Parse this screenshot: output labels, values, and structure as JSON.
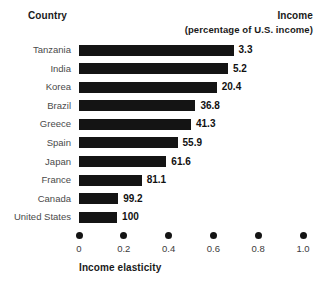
{
  "header": {
    "country_label": "Country",
    "income_label": "Income",
    "income_sublabel": "(percentage of U.S. income)"
  },
  "chart_data": {
    "type": "bar",
    "orientation": "horizontal",
    "title": "",
    "xlabel": "Income elasticity",
    "ylabel": "Country",
    "xlim": [
      0,
      1.0
    ],
    "xticks": [
      "0",
      "0.2",
      "0.4",
      "0.6",
      "0.8",
      "1.0"
    ],
    "xtick_values": [
      0,
      0.2,
      0.4,
      0.6,
      0.8,
      1.0
    ],
    "grid": false,
    "legend": "none",
    "bar_color": "#141414",
    "categories": [
      "Tanzania",
      "India",
      "Korea",
      "Brazil",
      "Greece",
      "Spain",
      "Japan",
      "France",
      "Canada",
      "United States"
    ],
    "values": [
      0.69,
      0.665,
      0.615,
      0.52,
      0.5,
      0.44,
      0.39,
      0.28,
      0.175,
      0.17
    ],
    "data_labels": [
      "3.3",
      "5.2",
      "20.4",
      "36.8",
      "41.3",
      "55.9",
      "61.6",
      "81.1",
      "99.2",
      "100"
    ],
    "data_label_name": "Income (percentage of U.S. income)",
    "rows": [
      {
        "country": "Tanzania",
        "elasticity": 0.69,
        "income": "3.3"
      },
      {
        "country": "India",
        "elasticity": 0.665,
        "income": "5.2"
      },
      {
        "country": "Korea",
        "elasticity": 0.615,
        "income": "20.4"
      },
      {
        "country": "Brazil",
        "elasticity": 0.52,
        "income": "36.8"
      },
      {
        "country": "Greece",
        "elasticity": 0.5,
        "income": "41.3"
      },
      {
        "country": "Spain",
        "elasticity": 0.44,
        "income": "55.9"
      },
      {
        "country": "Japan",
        "elasticity": 0.39,
        "income": "61.6"
      },
      {
        "country": "France",
        "elasticity": 0.28,
        "income": "81.1"
      },
      {
        "country": "Canada",
        "elasticity": 0.175,
        "income": "99.2"
      },
      {
        "country": "United States",
        "elasticity": 0.17,
        "income": "100"
      }
    ]
  }
}
